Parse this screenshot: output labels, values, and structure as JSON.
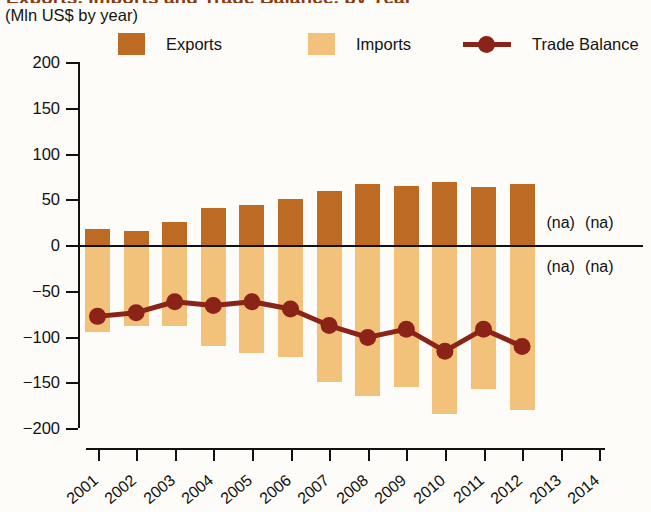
{
  "header": {
    "title_partial": "Exports, Imports and Trade Balance, by Year",
    "subtitle": "(Mln US$ by year)"
  },
  "legend": {
    "position": "top",
    "items": [
      {
        "label": "Exports",
        "type": "swatch",
        "color": "#bd6a23",
        "icon": "square-swatch-icon"
      },
      {
        "label": "Imports",
        "type": "swatch",
        "color": "#f2c27a",
        "icon": "square-swatch-icon"
      },
      {
        "label": "Trade Balance",
        "type": "line-marker",
        "color": "#8c2318",
        "icon": "line-marker-icon"
      }
    ]
  },
  "axes": {
    "y_ticks": [
      "200",
      "150",
      "100",
      "50",
      "0",
      "−50",
      "−100",
      "−150",
      "−200"
    ],
    "x_ticks": [
      "2001",
      "2002",
      "2003",
      "2004",
      "2005",
      "2006",
      "2007",
      "2008",
      "2009",
      "2010",
      "2011",
      "2012",
      "2013",
      "2014"
    ]
  },
  "annotations": {
    "na_label": "(na)",
    "na_points": [
      {
        "year": "2013",
        "series": "Exports",
        "side": "above"
      },
      {
        "year": "2014",
        "series": "Exports",
        "side": "above"
      },
      {
        "year": "2013",
        "series": "Imports",
        "side": "below"
      },
      {
        "year": "2014",
        "series": "Imports",
        "side": "below"
      }
    ]
  },
  "chart_data": {
    "type": "bar",
    "title": "Exports, Imports and Trade Balance, by Year",
    "subtitle": "(Mln US$ by year)",
    "xlabel": "",
    "ylabel": "Mln US$ by year",
    "ylim": [
      -200,
      200
    ],
    "ytick_step": 50,
    "grid": false,
    "legend_position": "top",
    "categories": [
      "2001",
      "2002",
      "2003",
      "2004",
      "2005",
      "2006",
      "2007",
      "2008",
      "2009",
      "2010",
      "2011",
      "2012",
      "2013",
      "2014"
    ],
    "series": [
      {
        "name": "Exports",
        "kind": "bar",
        "color": "#bd6a23",
        "values": [
          18,
          15,
          25,
          40,
          44,
          50,
          59,
          67,
          64,
          69,
          63,
          67,
          null,
          null
        ]
      },
      {
        "name": "Imports",
        "kind": "bar",
        "color": "#f2c27a",
        "values": [
          -95,
          -88,
          -88,
          -110,
          -118,
          -122,
          -150,
          -165,
          -155,
          -185,
          -157,
          -180,
          null,
          null
        ]
      },
      {
        "name": "Trade Balance",
        "kind": "line",
        "color": "#8c2318",
        "values": [
          -78,
          -74,
          -62,
          -66,
          -62,
          -70,
          -88,
          -101,
          -92,
          -116,
          -92,
          -111,
          null,
          null
        ]
      }
    ]
  }
}
